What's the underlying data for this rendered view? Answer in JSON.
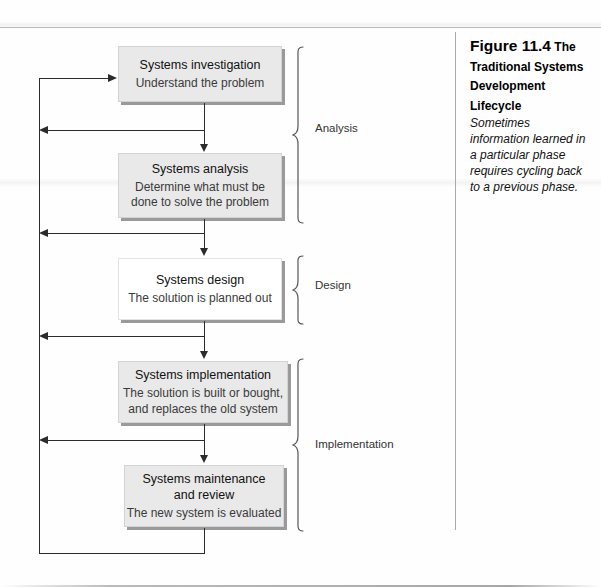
{
  "figure": {
    "number": "Figure 11.4",
    "title": "The Traditional Systems Development Lifecycle",
    "body": "Sometimes information learned in a particular phase requires cycling back to a previous phase."
  },
  "diagram": {
    "type": "flowchart",
    "nodes": [
      {
        "id": "investigation",
        "title": "Systems investigation",
        "desc": "Understand the problem"
      },
      {
        "id": "analysis",
        "title": "Systems analysis",
        "desc": "Determine what must be\ndone to solve the problem"
      },
      {
        "id": "design",
        "title": "Systems design",
        "desc": "The solution is planned out"
      },
      {
        "id": "implementation",
        "title": "Systems implementation",
        "desc": "The solution is built or bought,\nand replaces the old system"
      },
      {
        "id": "maintenance",
        "title": "Systems maintenance\nand review",
        "desc": "The new system is evaluated"
      }
    ],
    "phases": [
      {
        "id": "analysis-phase",
        "label": "Analysis"
      },
      {
        "id": "design-phase",
        "label": "Design"
      },
      {
        "id": "implementation-phase",
        "label": "Implementation"
      }
    ]
  }
}
